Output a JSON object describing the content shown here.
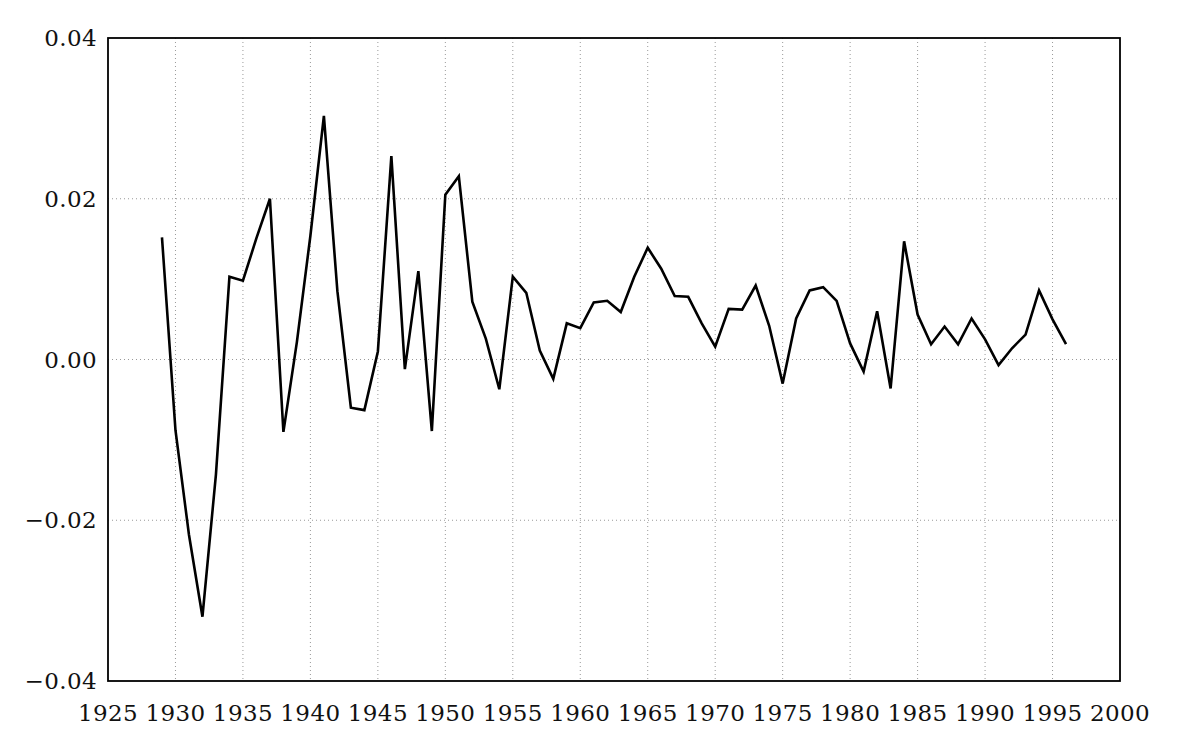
{
  "chart_data": {
    "type": "line",
    "title": "",
    "subtitle": "",
    "xlabel": "",
    "ylabel": "",
    "xlim": [
      1925,
      2000
    ],
    "ylim": [
      -0.04,
      0.04
    ],
    "grid": true,
    "legend": null,
    "x_ticks": [
      "1925",
      "1930",
      "1935",
      "1940",
      "1945",
      "1950",
      "1955",
      "1960",
      "1965",
      "1970",
      "1975",
      "1980",
      "1985",
      "1990",
      "1995",
      "2000"
    ],
    "x_tick_values": [
      1925,
      1930,
      1935,
      1940,
      1945,
      1950,
      1955,
      1960,
      1965,
      1970,
      1975,
      1980,
      1985,
      1990,
      1995,
      2000
    ],
    "y_ticks": [
      "0.04",
      "0.02",
      "0.00",
      "-0.02",
      "-0.04"
    ],
    "y_tick_values": [
      0.04,
      0.02,
      0.0,
      -0.02,
      -0.04
    ],
    "line_color": "#000000",
    "line_width": 2.6,
    "grid_color": "#999999",
    "axis_color": "#000000",
    "background_color": "#ffffff",
    "x": [
      1929,
      1930,
      1931,
      1932,
      1933,
      1934,
      1935,
      1936,
      1937,
      1938,
      1939,
      1940,
      1941,
      1942,
      1943,
      1944,
      1945,
      1946,
      1947,
      1948,
      1949,
      1950,
      1951,
      1952,
      1953,
      1954,
      1955,
      1956,
      1957,
      1958,
      1959,
      1960,
      1961,
      1962,
      1963,
      1964,
      1965,
      1966,
      1967,
      1968,
      1969,
      1970,
      1971,
      1972,
      1973,
      1974,
      1975,
      1976,
      1977,
      1978,
      1979,
      1980,
      1981,
      1982,
      1983,
      1984,
      1985,
      1986,
      1987,
      1988,
      1989,
      1990,
      1991,
      1992,
      1993,
      1994,
      1995,
      1996
    ],
    "values": [
      0.0152,
      -0.0088,
      -0.0218,
      -0.032,
      -0.0143,
      0.0103,
      0.0098,
      0.0151,
      0.02,
      -0.009,
      0.0022,
      0.0154,
      0.0303,
      0.0085,
      -0.006,
      -0.0063,
      0.001,
      0.0253,
      -0.0012,
      0.011,
      -0.0089,
      0.0205,
      0.0228,
      0.0072,
      0.0026,
      -0.0037,
      0.0103,
      0.0083,
      0.0011,
      -0.0024,
      0.0045,
      0.0039,
      0.0071,
      0.0073,
      0.0059,
      0.0103,
      0.0139,
      0.0113,
      0.0079,
      0.0078,
      0.0045,
      0.0016,
      0.0063,
      0.0062,
      0.0092,
      0.0042,
      -0.003,
      0.0051,
      0.0086,
      0.009,
      0.0073,
      0.002,
      -0.0015,
      0.006,
      -0.0036,
      0.0147,
      0.0056,
      0.0019,
      0.0041,
      0.0019,
      0.0051,
      0.0025,
      -0.0007,
      0.0014,
      0.0031,
      0.0086,
      0.005,
      0.0019
    ],
    "series_name": "series-1"
  },
  "geometry": {
    "plot_left": 108,
    "plot_right": 1120,
    "plot_top": 38,
    "plot_bottom": 681,
    "x_label_y": 700,
    "y_label_x": 97
  }
}
